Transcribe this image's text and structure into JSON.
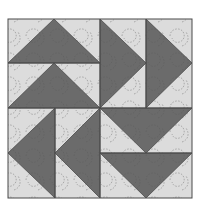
{
  "image": {
    "subject": "Flying geese quilt block",
    "colors": {
      "background": "#ffffff",
      "light_fabric": "#dcdcdc",
      "dark_fabric": "#6b6b6b",
      "seam_line": "#4a4a4a",
      "quilting_stitch": "#555555"
    },
    "block": {
      "left": 8,
      "top": 19,
      "right": 192,
      "bottom": 198,
      "center_x": 100,
      "center_y": 108
    },
    "quadrants": [
      {
        "name": "top-left",
        "direction": "up",
        "geese": [
          [
            [
              8,
              63
            ],
            [
              54,
              19
            ],
            [
              100,
              63
            ]
          ],
          [
            [
              8,
              108
            ],
            [
              54,
              63
            ],
            [
              100,
              108
            ]
          ]
        ]
      },
      {
        "name": "top-right",
        "direction": "right",
        "geese": [
          [
            [
              100,
              19
            ],
            [
              146,
              63
            ],
            [
              100,
              108
            ]
          ],
          [
            [
              146,
              19
            ],
            [
              192,
              63
            ],
            [
              146,
              108
            ]
          ]
        ]
      },
      {
        "name": "bottom-left",
        "direction": "left",
        "geese": [
          [
            [
              55,
              108
            ],
            [
              8,
              153
            ],
            [
              55,
              198
            ]
          ],
          [
            [
              100,
              108
            ],
            [
              55,
              153
            ],
            [
              100,
              198
            ]
          ]
        ]
      },
      {
        "name": "bottom-right",
        "direction": "down",
        "geese": [
          [
            [
              100,
              108
            ],
            [
              146,
              153
            ],
            [
              192,
              108
            ]
          ],
          [
            [
              100,
              153
            ],
            [
              146,
              198
            ],
            [
              192,
              153
            ]
          ]
        ]
      }
    ]
  }
}
